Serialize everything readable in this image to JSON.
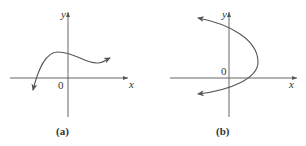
{
  "figures": [
    {
      "id": "a",
      "caption": "(a)",
      "x_label": "x",
      "y_label": "y",
      "origin_label": "0",
      "description": "Cubic-like curve: falls off to lower-left with arrow, rises to local max left of y-axis, dips to local min right, continues up-right with arrow"
    },
    {
      "id": "b",
      "caption": "(b)",
      "x_label": "x",
      "y_label": "y",
      "origin_label": "0",
      "description": "Sideways parabola opening left, vertex to the right of y-axis above x-axis, arrows at both ends pointing left"
    }
  ]
}
